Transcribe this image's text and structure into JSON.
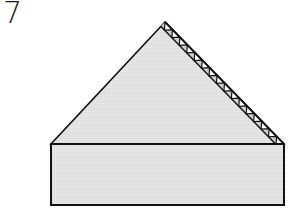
{
  "step": {
    "number": "7"
  },
  "diagram": {
    "fill_color": "#e4e4e4",
    "stroke_color": "#111111",
    "stripe_light_color": "#ffffff",
    "apex": [
      165,
      22
    ],
    "triangle_base_left": [
      51,
      144
    ],
    "triangle_base_right": [
      284,
      144
    ],
    "rectangle": {
      "x": 51,
      "y": 144,
      "width": 233,
      "height": 61
    },
    "zigzag_band_width": 6,
    "zigzag_count": 16
  }
}
